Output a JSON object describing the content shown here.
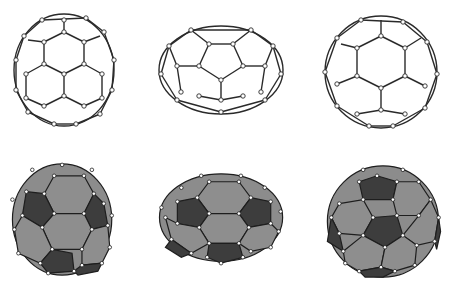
{
  "figure": {
    "rows": [
      {
        "name": "ball-and-stick",
        "style": "wireframe with atoms as open circles"
      },
      {
        "name": "polyhedral",
        "style": "shaded faces; hexagons light gray, pentagons dark gray"
      }
    ],
    "columns": [
      {
        "name": "molecule-1",
        "shape": "slightly elongated vertically"
      },
      {
        "name": "molecule-2",
        "shape": "elongated horizontally (ellipsoidal)"
      },
      {
        "name": "molecule-3",
        "shape": "near-spherical"
      }
    ],
    "colors": {
      "background": "#ffffff",
      "bond": "#2a2a2a",
      "hexagon_face": "#8e8e8e",
      "pentagon_face": "#3d3d3d",
      "atom": "#ffffff"
    }
  }
}
